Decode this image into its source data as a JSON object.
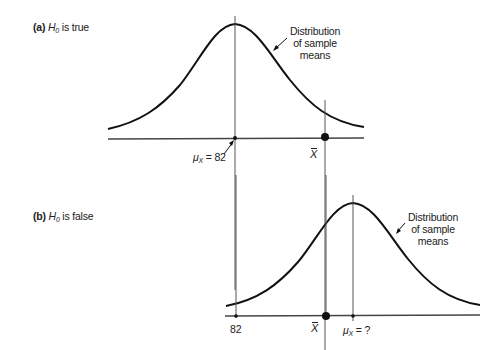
{
  "panels": [
    {
      "id": "a",
      "tag": "(a)",
      "hypothesis_symbol": "H",
      "hypothesis_subscript": "0",
      "condition_text": " is true",
      "callout_lines": [
        "Distribution",
        "of sample",
        "means"
      ],
      "mean_label_symbol": "μ",
      "mean_label_subscript": "X",
      "mean_label_value": " = 82",
      "sample_mean_label": "X"
    },
    {
      "id": "b",
      "tag": "(b)",
      "hypothesis_symbol": "H",
      "hypothesis_subscript": "0",
      "condition_text": " is false",
      "callout_lines": [
        "Distribution",
        "of sample",
        "means"
      ],
      "hyp_mean_value": "82",
      "mean_label_symbol": "μ",
      "mean_label_subscript": "X",
      "mean_label_value": " = ?",
      "sample_mean_label": "X"
    }
  ],
  "colors": {
    "curve": "#111111",
    "axis": "#444444",
    "guide": "#555555",
    "text": "#222222"
  }
}
